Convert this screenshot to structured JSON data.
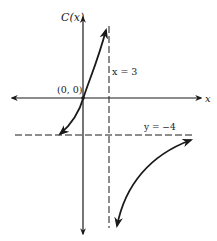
{
  "diagram": {
    "type": "function-graph",
    "y_axis_label": "C(x)",
    "x_axis_label": "x",
    "origin_label": "(0, 0)",
    "vertical_asymptote_label": "x = 3",
    "horizontal_asymptote_label": "y = −4",
    "colors": {
      "ink": "#1a1a1a",
      "background": "#ffffff"
    }
  }
}
